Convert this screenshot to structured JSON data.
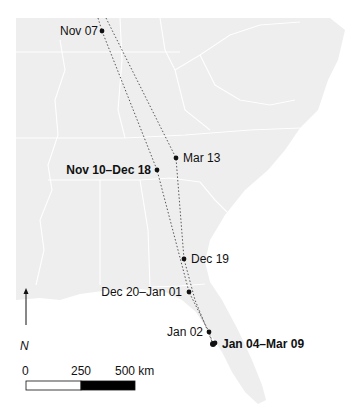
{
  "map": {
    "land_color": "#eeeeee",
    "border_color": "#ffffff",
    "water_color": "#ffffff",
    "track_color": "#555555",
    "point_color": "#111111"
  },
  "locations": [
    {
      "label": "Nov 07",
      "bold": false,
      "x": 102,
      "y": 31,
      "side": "left"
    },
    {
      "label": "Mar 13",
      "bold": false,
      "x": 176,
      "y": 158,
      "side": "right"
    },
    {
      "label": "Nov 10–Dec 18",
      "bold": true,
      "x": 157,
      "y": 170,
      "side": "left"
    },
    {
      "label": "Dec 19",
      "bold": false,
      "x": 184,
      "y": 259,
      "side": "right"
    },
    {
      "label": "Dec 20–Jan 01",
      "bold": false,
      "x": 189,
      "y": 292,
      "side": "left"
    },
    {
      "label": "Jan 02",
      "bold": false,
      "x": 209,
      "y": 332,
      "side": "left"
    },
    {
      "label": "Jan 04–Mar 09",
      "bold": true,
      "x": 213,
      "y": 344,
      "side": "right"
    }
  ],
  "north_arrow": {
    "label": "N",
    "icon": "north-arrow-icon"
  },
  "scale_bar": {
    "ticks": [
      "0",
      "250",
      "500 km"
    ],
    "segments": [
      {
        "fill": "#ffffff"
      },
      {
        "fill": "#000000"
      }
    ]
  }
}
